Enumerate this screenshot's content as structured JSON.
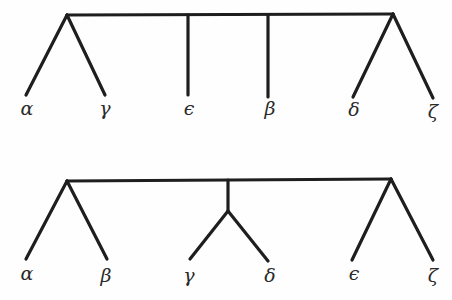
{
  "trees": [
    {
      "id": "top-tree",
      "description": "Tree with root bar; alpha,gamma grouped; epsilon, beta single; delta,zeta grouped",
      "leaves": [
        {
          "name": "alpha",
          "symbol": "α"
        },
        {
          "name": "gamma",
          "symbol": "γ"
        },
        {
          "name": "epsilon",
          "symbol": "ϵ"
        },
        {
          "name": "beta",
          "symbol": "β"
        },
        {
          "name": "delta",
          "symbol": "δ"
        },
        {
          "name": "zeta",
          "symbol": "ζ"
        }
      ]
    },
    {
      "id": "bottom-tree",
      "description": "Tree with root bar; alpha,beta grouped; gamma,delta grouped under center node; epsilon,zeta grouped",
      "leaves": [
        {
          "name": "alpha",
          "symbol": "α"
        },
        {
          "name": "beta",
          "symbol": "β"
        },
        {
          "name": "gamma",
          "symbol": "γ"
        },
        {
          "name": "delta",
          "symbol": "δ"
        },
        {
          "name": "epsilon",
          "symbol": "ϵ"
        },
        {
          "name": "zeta",
          "symbol": "ζ"
        }
      ]
    }
  ],
  "colors": {
    "line": "#1e1e1e",
    "text": "#2a2a2a",
    "background": "#fefefe"
  }
}
